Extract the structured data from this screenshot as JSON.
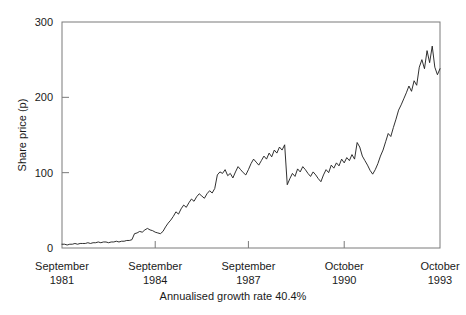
{
  "chart_data": {
    "type": "line",
    "title": "",
    "subtitle": "",
    "xlabel": "",
    "ylabel": "Share price (p)",
    "caption": "Annualised growth rate 40.4%",
    "grid": false,
    "legend": "none",
    "line_color": "#1a1a1a",
    "frame_color": "#7a7a7a",
    "background": "#ffffff",
    "ylim": [
      0,
      300
    ],
    "yticks": [
      0,
      100,
      200,
      300
    ],
    "ytick_labels": [
      "0",
      "100",
      "200",
      "300"
    ],
    "xlim": [
      0,
      146
    ],
    "xticks": [
      0,
      36,
      72,
      109,
      146
    ],
    "xtick_labels": [
      {
        "month": "September",
        "year": "1981"
      },
      {
        "month": "September",
        "year": "1984"
      },
      {
        "month": "September",
        "year": "1987"
      },
      {
        "month": "October",
        "year": "1990"
      },
      {
        "month": "October",
        "year": "1993"
      }
    ],
    "x_unit": "months since September 1981",
    "series": [
      {
        "name": "Share price",
        "x": [
          0,
          1,
          2,
          3,
          4,
          5,
          6,
          7,
          8,
          9,
          10,
          11,
          12,
          13,
          14,
          15,
          16,
          17,
          18,
          19,
          20,
          21,
          22,
          23,
          24,
          25,
          26,
          27,
          28,
          29,
          30,
          31,
          32,
          33,
          34,
          35,
          36,
          37,
          38,
          39,
          40,
          41,
          42,
          43,
          44,
          45,
          46,
          47,
          48,
          49,
          50,
          51,
          52,
          53,
          54,
          55,
          56,
          57,
          58,
          59,
          60,
          61,
          62,
          63,
          64,
          65,
          66,
          67,
          68,
          69,
          70,
          71,
          72,
          73,
          74,
          75,
          76,
          77,
          78,
          79,
          80,
          81,
          82,
          83,
          84,
          85,
          86,
          87,
          88,
          89,
          90,
          91,
          92,
          93,
          94,
          95,
          96,
          97,
          98,
          99,
          100,
          101,
          102,
          103,
          104,
          105,
          106,
          107,
          108,
          109,
          110,
          111,
          112,
          113,
          114,
          115,
          116,
          117,
          118,
          119,
          120,
          121,
          122,
          123,
          124,
          125,
          126,
          127,
          128,
          129,
          130,
          131,
          132,
          133,
          134,
          135,
          136,
          137,
          138,
          139,
          140,
          141,
          142,
          143,
          144,
          145,
          146
        ],
        "values": [
          5,
          5,
          4,
          5,
          5,
          6,
          5,
          6,
          6,
          6,
          7,
          6,
          7,
          7,
          8,
          7,
          8,
          8,
          7,
          8,
          8,
          9,
          8,
          9,
          9,
          10,
          10,
          11,
          19,
          20,
          22,
          21,
          24,
          26,
          24,
          23,
          21,
          20,
          19,
          22,
          28,
          33,
          37,
          42,
          48,
          45,
          52,
          57,
          54,
          60,
          65,
          62,
          68,
          72,
          69,
          66,
          72,
          76,
          73,
          79,
          97,
          101,
          99,
          104,
          96,
          99,
          93,
          101,
          108,
          104,
          100,
          97,
          104,
          112,
          118,
          114,
          110,
          116,
          122,
          118,
          126,
          121,
          130,
          126,
          134,
          130,
          137,
          84,
          92,
          99,
          95,
          105,
          101,
          108,
          104,
          99,
          95,
          101,
          97,
          92,
          88,
          97,
          104,
          100,
          110,
          106,
          113,
          109,
          118,
          113,
          120,
          116,
          124,
          118,
          140,
          134,
          122,
          116,
          110,
          103,
          98,
          104,
          112,
          122,
          130,
          141,
          152,
          148,
          160,
          171,
          183,
          190,
          198,
          206,
          215,
          208,
          222,
          216,
          240,
          250,
          238,
          262,
          246,
          268,
          240,
          230,
          238
        ],
        "values_meta": "monthly share price in pence"
      }
    ],
    "annotations": []
  },
  "y_axis": {
    "title": "Share price (p)",
    "ticks": [
      "0",
      "100",
      "200",
      "300"
    ]
  },
  "x_axis": {
    "labels": [
      {
        "month": "September",
        "year": "1981"
      },
      {
        "month": "September",
        "year": "1984"
      },
      {
        "month": "September",
        "year": "1987"
      },
      {
        "month": "October",
        "year": "1990"
      },
      {
        "month": "October",
        "year": "1993"
      }
    ]
  },
  "footer": {
    "caption": "Annualised growth rate 40.4%"
  }
}
